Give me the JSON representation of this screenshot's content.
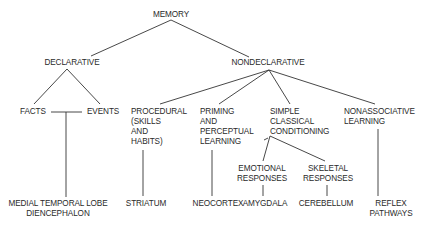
{
  "diagram": {
    "type": "tree",
    "root": "MEMORY",
    "nodes": {
      "memory": "MEMORY",
      "declarative": "DECLARATIVE",
      "nondeclarative": "NONDECLARATIVE",
      "facts": "FACTS",
      "events": "EVENTS",
      "procedural": [
        "PROCEDURAL",
        "(SKILLS",
        "AND",
        "HABITS)"
      ],
      "priming": [
        "PRIMING",
        "AND",
        "PERCEPTUAL",
        "LEARNING"
      ],
      "simple": [
        "SIMPLE",
        "CLASSICAL",
        "CONDITIONING"
      ],
      "nonassociative": [
        "NONASSOCIATIVE",
        "LEARNING"
      ],
      "emotional": [
        "EMOTIONAL",
        "RESPONSES"
      ],
      "skeletal": [
        "SKELETAL",
        "RESPONSES"
      ],
      "mtl": [
        "MEDIAL TEMPORAL LOBE",
        "DIENCEPHALON"
      ],
      "striatum": "STRIATUM",
      "neocortex": "NEOCORTEX",
      "amygdala": "AMYGDALA",
      "cerebellum": "CEREBELLUM",
      "reflex": [
        "REFLEX",
        "PATHWAYS"
      ]
    },
    "edges": [
      [
        "MEMORY",
        "DECLARATIVE"
      ],
      [
        "MEMORY",
        "NONDECLARATIVE"
      ],
      [
        "DECLARATIVE",
        "FACTS"
      ],
      [
        "DECLARATIVE",
        "EVENTS"
      ],
      [
        "FACTS/EVENTS",
        "MEDIAL TEMPORAL LOBE DIENCEPHALON"
      ],
      [
        "NONDECLARATIVE",
        "PROCEDURAL (SKILLS AND HABITS)"
      ],
      [
        "NONDECLARATIVE",
        "PRIMING AND PERCEPTUAL LEARNING"
      ],
      [
        "NONDECLARATIVE",
        "SIMPLE CLASSICAL CONDITIONING"
      ],
      [
        "NONDECLARATIVE",
        "NONASSOCIATIVE LEARNING"
      ],
      [
        "PROCEDURAL",
        "STRIATUM"
      ],
      [
        "PRIMING",
        "NEOCORTEX"
      ],
      [
        "SIMPLE CLASSICAL CONDITIONING",
        "EMOTIONAL RESPONSES"
      ],
      [
        "SIMPLE CLASSICAL CONDITIONING",
        "SKELETAL RESPONSES"
      ],
      [
        "EMOTIONAL RESPONSES",
        "AMYGDALA"
      ],
      [
        "SKELETAL RESPONSES",
        "CEREBELLUM"
      ],
      [
        "NONASSOCIATIVE LEARNING",
        "REFLEX PATHWAYS"
      ]
    ]
  }
}
